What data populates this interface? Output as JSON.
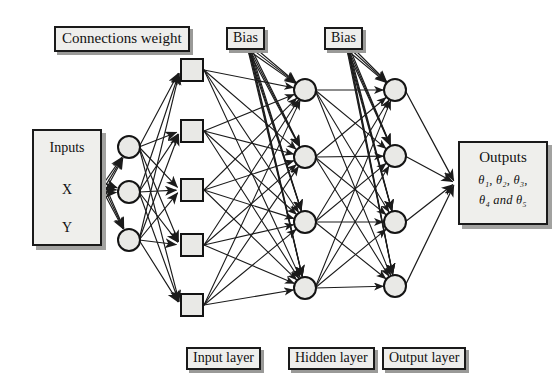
{
  "diagram": {
    "type": "neural-network-architecture",
    "title_labels": {
      "connections_weight": "Connections weight",
      "bias_left": "Bias",
      "bias_right": "Bias"
    },
    "inputs_panel": {
      "heading": "Inputs",
      "variables": [
        "X",
        "Y"
      ]
    },
    "outputs_panel": {
      "heading": "Outputs",
      "line1": "θ₁, θ₂, θ₃,",
      "line2": "θ₄ and θ₅",
      "symbols": [
        "θ₁",
        "θ₂",
        "θ₃",
        "θ₄",
        "θ₅"
      ]
    },
    "layer_labels": {
      "input": "Input layer",
      "hidden": "Hidden layer",
      "output": "Output layer"
    },
    "layers": [
      {
        "name": "input-nodes",
        "shape": "circle",
        "count": 3,
        "cx": 129,
        "cy": [
          147,
          192,
          240
        ],
        "r": 11
      },
      {
        "name": "input-layer-weights",
        "shape": "square",
        "count": 5,
        "cx": 192,
        "cy": [
          70,
          131,
          190,
          245,
          305
        ],
        "size": 22
      },
      {
        "name": "hidden-nodes",
        "shape": "circle",
        "count": 4,
        "cx": 305,
        "cy": [
          90,
          157,
          222,
          288
        ],
        "r": 11
      },
      {
        "name": "output-nodes",
        "shape": "circle",
        "count": 4,
        "cx": 395,
        "cy": [
          90,
          156,
          222,
          286
        ],
        "r": 11
      }
    ],
    "bias_sources": [
      {
        "name": "bias-left",
        "x": 248,
        "y": 46
      },
      {
        "name": "bias-right",
        "x": 347,
        "y": 46
      }
    ],
    "colors": {
      "node_fill": "#e9e9e6",
      "node_stroke": "#141414",
      "edge": "#1b1b1b",
      "box_fill": "#eeeeec",
      "box_border": "#1a1a1a",
      "box_shadow": "#9a9a98",
      "background": "#ffffff"
    }
  }
}
